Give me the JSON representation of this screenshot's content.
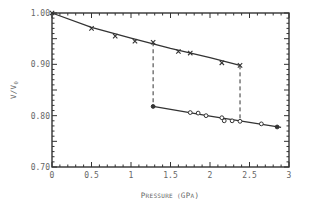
{
  "chart_data": {
    "type": "line",
    "title": "",
    "xlabel": "Pressure (GPa)",
    "ylabel": "V/V0",
    "xlim": [
      0,
      3
    ],
    "ylim": [
      0.7,
      1.0
    ],
    "x_ticks": [
      "0",
      "0.5",
      "1",
      "1.5",
      "2",
      "2.5",
      "3"
    ],
    "y_ticks": [
      "0.70",
      "0.80",
      "0.90",
      "1.00"
    ],
    "grid": false,
    "legend": null,
    "series": [
      {
        "name": "Low-pressure phase",
        "marker": "x",
        "x": [
          0,
          0.5,
          0.8,
          1.05,
          1.28,
          1.6,
          1.75,
          2.15,
          2.38
        ],
        "y": [
          1.0,
          0.97,
          0.955,
          0.945,
          0.943,
          0.925,
          0.922,
          0.903,
          0.898
        ],
        "fit_line": "solid"
      },
      {
        "name": "High-pressure phase",
        "marker": "o",
        "x": [
          1.28,
          1.75,
          1.85,
          1.95,
          2.15,
          2.18,
          2.28,
          2.38,
          2.65,
          2.85
        ],
        "y": [
          0.818,
          0.806,
          0.805,
          0.8,
          0.796,
          0.79,
          0.79,
          0.789,
          0.784,
          0.778
        ],
        "fit_line": "solid"
      }
    ],
    "annotations": [
      {
        "type": "dashed-vertical",
        "x": 1.28,
        "y_from": 0.818,
        "y_to": 0.943
      },
      {
        "type": "dashed-vertical",
        "x": 2.38,
        "y_from": 0.789,
        "y_to": 0.898
      }
    ]
  },
  "labels": {
    "xlabel": "Pressure (GPa)",
    "ylabel": "V/V0"
  }
}
